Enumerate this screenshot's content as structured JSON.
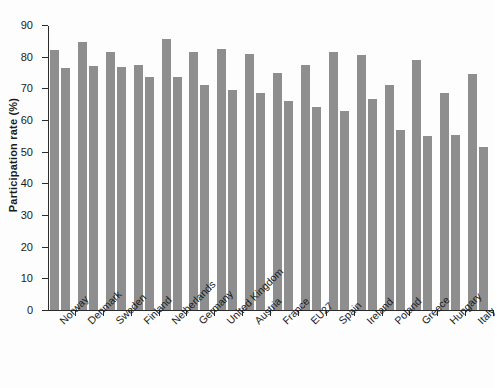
{
  "chart_data": {
    "type": "bar",
    "title": "",
    "subtitle": "",
    "xlabel": "",
    "ylabel": "Participation rate (%)",
    "ylim": [
      0,
      90
    ],
    "yticks": [
      0,
      10,
      20,
      30,
      40,
      50,
      60,
      70,
      80,
      90
    ],
    "grid": false,
    "legend": "none",
    "bar_color": "#8e8e8e",
    "axis_color": "#2b2b2b",
    "background": "#ffffff",
    "categories": [
      "Norway",
      "Denmark",
      "Sweden",
      "Finland",
      "Netherlands",
      "Germany",
      "United Kingdom",
      "Austria",
      "France",
      "EU27",
      "Spain",
      "Ireland",
      "Poland",
      "Greece",
      "Hungary",
      "Italy"
    ],
    "series": [
      {
        "name": "series-1",
        "values": [
          82.0,
          84.5,
          81.5,
          77.5,
          85.5,
          81.5,
          82.5,
          81.0,
          75.0,
          77.5,
          81.5,
          80.5,
          71.0,
          79.0,
          68.5,
          74.5
        ]
      },
      {
        "name": "series-2",
        "values": [
          76.5,
          77.0,
          76.8,
          73.5,
          73.5,
          71.0,
          69.5,
          68.5,
          66.0,
          64.0,
          63.0,
          66.5,
          57.0,
          55.0,
          55.2,
          51.5
        ]
      }
    ]
  }
}
